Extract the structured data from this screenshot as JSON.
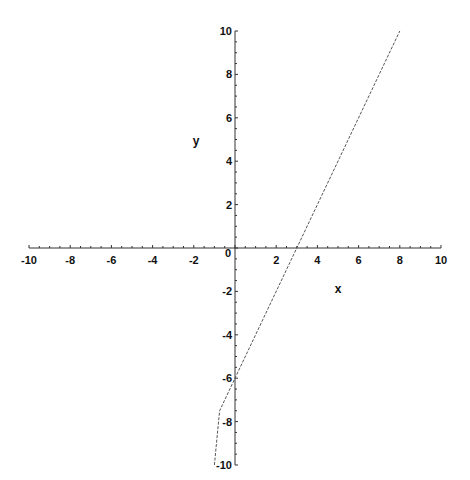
{
  "chart_data": {
    "type": "line",
    "title": "",
    "xlabel": "x",
    "ylabel": "y",
    "xlim": [
      -10,
      10
    ],
    "ylim": [
      -10,
      10
    ],
    "grid": false,
    "legend": null,
    "x_ticks": [
      -10,
      -8,
      -6,
      -4,
      -2,
      0,
      2,
      4,
      6,
      8,
      10
    ],
    "y_ticks": [
      -10,
      -8,
      -6,
      -4,
      -2,
      2,
      4,
      6,
      8,
      10
    ],
    "origin_label": "0",
    "series": [
      {
        "name": "y = 2x - 6",
        "style": "dotted",
        "x": [
          -1.0,
          -0.75,
          0,
          3,
          8
        ],
        "y": [
          -10,
          -7.5,
          -6,
          0,
          10
        ]
      }
    ],
    "colors": {
      "axes": "#333333",
      "line": "#555555",
      "text": "#111111"
    }
  }
}
